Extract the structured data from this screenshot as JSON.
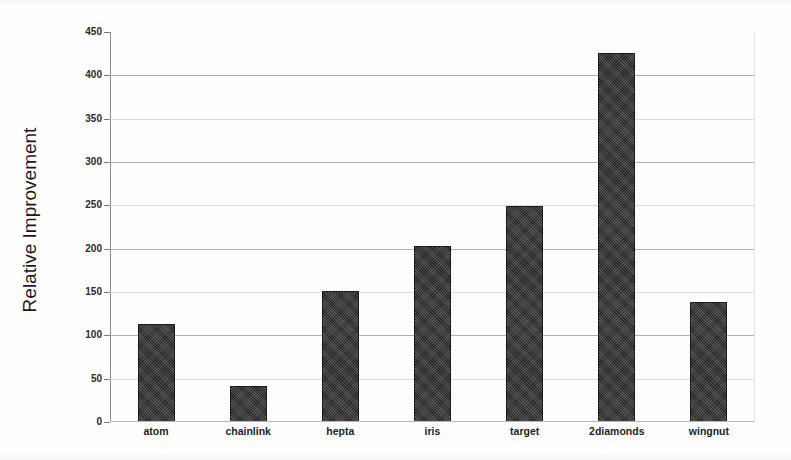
{
  "chart_data": {
    "type": "bar",
    "title": "",
    "xlabel": "",
    "ylabel": "Relative Improvement",
    "ylim": [
      0,
      450
    ],
    "ytick_step": 50,
    "yticks": [
      0,
      50,
      100,
      150,
      200,
      250,
      300,
      350,
      400,
      450
    ],
    "ytick_labels": [
      "0",
      "50",
      "100",
      "150",
      "200",
      "250",
      "300",
      "350",
      "400",
      "450"
    ],
    "grid": "horizontal",
    "legend": "none",
    "categories": [
      "atom",
      "chainlink",
      "hepta",
      "iris",
      "target",
      "2diamonds",
      "wingnut"
    ],
    "values": [
      113,
      41,
      151,
      203,
      249,
      426,
      139
    ],
    "series": [
      {
        "name": "Relative Improvement",
        "values": [
          113,
          41,
          151,
          203,
          249,
          426,
          139
        ],
        "color": "#232323"
      }
    ]
  },
  "axes": {
    "y_title": "Relative Improvement"
  }
}
